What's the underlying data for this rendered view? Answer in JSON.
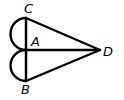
{
  "diagram": {
    "type": "geometry",
    "points": {
      "C": {
        "label": "C",
        "x": 26,
        "y": 18
      },
      "A": {
        "label": "A",
        "x": 26,
        "y": 50
      },
      "B": {
        "label": "B",
        "x": 26,
        "y": 81
      },
      "D": {
        "label": "D",
        "x": 100,
        "y": 50
      }
    },
    "segments": [
      "CA",
      "AB",
      "CD",
      "AD",
      "BD"
    ],
    "arcs": [
      "semicircle on CA (left)",
      "semicircle on AB (left)"
    ],
    "stroke_color": "#000000"
  }
}
